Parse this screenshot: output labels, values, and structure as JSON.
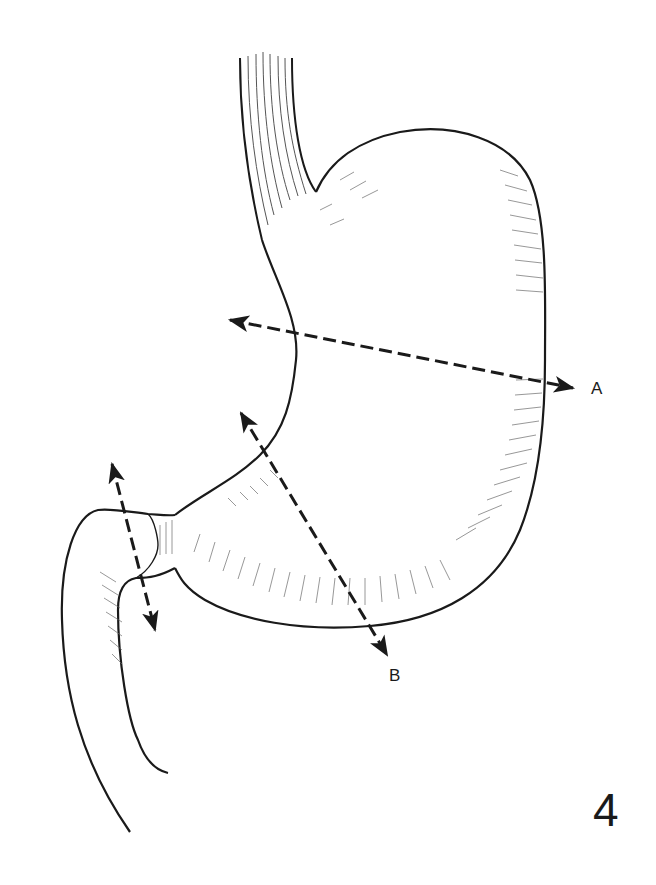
{
  "figure": {
    "number": "4",
    "colors": {
      "ink": "#1a1a1a",
      "hatch": "#555555",
      "background": "#ffffff"
    }
  },
  "labels": {
    "a": "A",
    "b": "B"
  },
  "arrows": [
    {
      "id": "A",
      "from": [
        228,
        320
      ],
      "to": [
        575,
        388
      ],
      "style": "dashed",
      "heads": "both"
    },
    {
      "id": "B",
      "from": [
        240,
        412
      ],
      "to": [
        388,
        656
      ],
      "style": "dashed",
      "heads": "both"
    },
    {
      "id": "pylorus",
      "from": [
        112,
        462
      ],
      "to": [
        155,
        632
      ],
      "style": "dashed",
      "heads": "both"
    }
  ]
}
